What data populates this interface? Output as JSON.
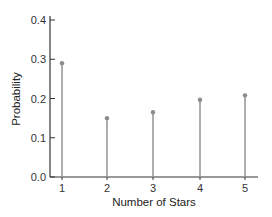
{
  "chart_data": {
    "type": "bar",
    "subtype": "stem",
    "title": "",
    "xlabel": "Number of Stars",
    "ylabel": "Probability",
    "categories": [
      "1",
      "2",
      "3",
      "4",
      "5"
    ],
    "values": [
      0.29,
      0.15,
      0.165,
      0.197,
      0.208
    ],
    "ylim": [
      0.0,
      0.4
    ],
    "yticks": [
      "0.0",
      "0.1",
      "0.2",
      "0.3",
      "0.4"
    ],
    "grid": false,
    "legend": null,
    "colors": {
      "stem": "#9a9a9a",
      "marker": "#8c8c8c",
      "axis": "#333333"
    }
  }
}
